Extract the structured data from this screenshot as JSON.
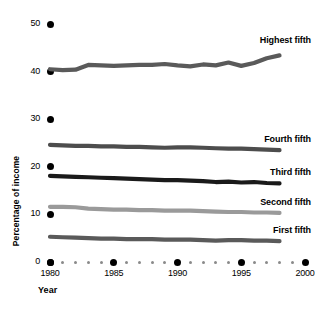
{
  "chart_data": {
    "type": "line",
    "title": "",
    "xlabel": "Year",
    "ylabel": "Percentage of income",
    "xlim": [
      1980,
      2000
    ],
    "ylim": [
      0,
      50
    ],
    "grid": false,
    "legend_position": "inline-right-of-series",
    "x": [
      1980,
      1981,
      1982,
      1983,
      1984,
      1985,
      1986,
      1987,
      1988,
      1989,
      1990,
      1991,
      1992,
      1993,
      1994,
      1995,
      1996,
      1997,
      1998
    ],
    "series": [
      {
        "name": "Highest fifth",
        "color": "#5a5a5a",
        "values": [
          40.5,
          40.3,
          40.4,
          41.4,
          41.3,
          41.2,
          41.3,
          41.4,
          41.4,
          41.6,
          41.3,
          41.1,
          41.5,
          41.3,
          41.9,
          41.2,
          41.8,
          42.8,
          43.4
        ]
      },
      {
        "name": "Fourth fifth",
        "color": "#4d4d4d",
        "values": [
          24.6,
          24.5,
          24.4,
          24.4,
          24.3,
          24.3,
          24.2,
          24.2,
          24.1,
          24.0,
          24.1,
          24.1,
          24.0,
          23.9,
          23.8,
          23.8,
          23.7,
          23.6,
          23.5
        ]
      },
      {
        "name": "Third fifth",
        "color": "#1a1a1a",
        "values": [
          18.1,
          18.0,
          17.9,
          17.8,
          17.7,
          17.6,
          17.5,
          17.4,
          17.3,
          17.2,
          17.2,
          17.1,
          17.0,
          16.8,
          16.9,
          16.7,
          16.8,
          16.6,
          16.5
        ]
      },
      {
        "name": "Second fifth",
        "color": "#9a9a9a",
        "values": [
          11.6,
          11.6,
          11.5,
          11.2,
          11.1,
          11.0,
          11.0,
          10.9,
          10.9,
          10.8,
          10.8,
          10.8,
          10.7,
          10.6,
          10.5,
          10.5,
          10.4,
          10.4,
          10.3
        ]
      },
      {
        "name": "First fifth",
        "color": "#5a5a5a",
        "values": [
          5.3,
          5.2,
          5.1,
          5.0,
          4.9,
          4.9,
          4.8,
          4.8,
          4.8,
          4.7,
          4.7,
          4.7,
          4.6,
          4.5,
          4.6,
          4.6,
          4.5,
          4.5,
          4.4
        ]
      }
    ],
    "y_ticks": [
      0,
      10,
      20,
      30,
      40,
      50
    ],
    "x_ticks_major": [
      1980,
      1985,
      1990,
      1995,
      2000
    ],
    "x_ticks_minor": [
      1981,
      1982,
      1983,
      1984,
      1986,
      1987,
      1988,
      1989,
      1991,
      1992,
      1993,
      1994,
      1996,
      1997,
      1998,
      1999
    ]
  },
  "labels": {
    "y_title": "Percentage of income",
    "x_title": "Year",
    "y_tick_texts": [
      "0",
      "10",
      "20",
      "30",
      "40",
      "50"
    ],
    "x_tick_texts": [
      "1980",
      "1985",
      "1990",
      "1995",
      "2000"
    ],
    "series_names": [
      "Highest fifth",
      "Fourth fifth",
      "Third fifth",
      "Second fifth",
      "First fifth"
    ]
  },
  "colors": {
    "background": "#ffffff",
    "text": "#000000",
    "major_tick": "#000000",
    "minor_tick": "#8a8a8a",
    "highest_fifth": "#5a5a5a",
    "fourth_fifth": "#4d4d4d",
    "third_fifth": "#1a1a1a",
    "second_fifth": "#9a9a9a",
    "first_fifth": "#5a5a5a"
  }
}
